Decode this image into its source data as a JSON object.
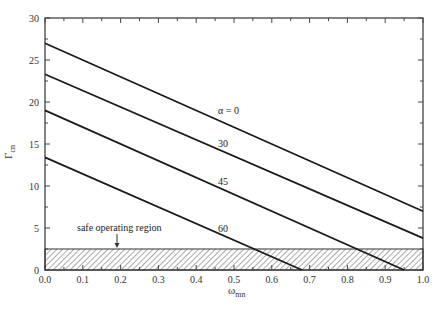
{
  "chart_data": {
    "type": "line",
    "title": "",
    "xlabel": "ω_mn",
    "ylabel": "Γ_cn",
    "xlim": [
      0.0,
      1.0
    ],
    "ylim": [
      0,
      30
    ],
    "grid": false,
    "legend": "inline labels on curves",
    "x_ticks": [
      "0.0",
      "0.1",
      "0.2",
      "0.3",
      "0.4",
      "0.5",
      "0.6",
      "0.7",
      "0.8",
      "0.9",
      "1.0"
    ],
    "y_ticks": [
      "0",
      "5",
      "10",
      "15",
      "20",
      "25",
      "30"
    ],
    "series": [
      {
        "name": "α = 0",
        "label": "α = 0",
        "x": [
          0.0,
          1.0
        ],
        "y": [
          27.0,
          7.0
        ]
      },
      {
        "name": "30",
        "label": "30",
        "x": [
          0.0,
          1.0
        ],
        "y": [
          23.3,
          3.8
        ]
      },
      {
        "name": "45",
        "label": "45",
        "x": [
          0.0,
          0.95
        ],
        "y": [
          19.0,
          0.0
        ]
      },
      {
        "name": "60",
        "label": "60",
        "x": [
          0.0,
          0.68
        ],
        "y": [
          13.4,
          0.0
        ]
      }
    ],
    "annotations": [
      {
        "text": "safe operating region",
        "type": "hatched band",
        "y_range": [
          0,
          2.5
        ],
        "arrow_x": 0.19
      }
    ]
  },
  "labels": {
    "xlabel_main": "ω",
    "xlabel_sub": "mn",
    "ylabel_main": "Γ",
    "ylabel_sub": "cn",
    "safe_region": "safe operating region",
    "curve_0": "α = 0",
    "curve_30": "30",
    "curve_45": "45",
    "curve_60": "60"
  }
}
